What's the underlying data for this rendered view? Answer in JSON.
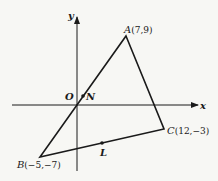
{
  "diagram": {
    "type": "coordinate-geometry-triangle",
    "axes": {
      "x_label": "x",
      "y_label": "y",
      "origin_label": "O"
    },
    "vertices": [
      {
        "id": "A",
        "label": "A",
        "coords": "(7,9)"
      },
      {
        "id": "B",
        "label": "B",
        "coords": "(−5,−7)"
      },
      {
        "id": "C",
        "label": "C",
        "coords": "(12,−3)"
      }
    ],
    "points": [
      {
        "id": "N",
        "label": "N",
        "on_segment": "AB"
      },
      {
        "id": "L",
        "label": "L",
        "on_segment": "BC"
      }
    ],
    "colors": {
      "ink": "#1a1a1a",
      "background": "#f7f7f4"
    }
  }
}
